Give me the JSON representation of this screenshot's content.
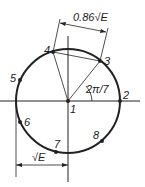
{
  "diagram": {
    "type": "8-PSK constellation",
    "points": [
      {
        "id": "1",
        "label": "1"
      },
      {
        "id": "2",
        "label": "2"
      },
      {
        "id": "3",
        "label": "3"
      },
      {
        "id": "4",
        "label": "4"
      },
      {
        "id": "5",
        "label": "5"
      },
      {
        "id": "6",
        "label": "6"
      },
      {
        "id": "7",
        "label": "7"
      },
      {
        "id": "8",
        "label": "8"
      }
    ],
    "angle_label": "2π/7",
    "chord_label": "0.86√E",
    "radius_label": "√E"
  }
}
